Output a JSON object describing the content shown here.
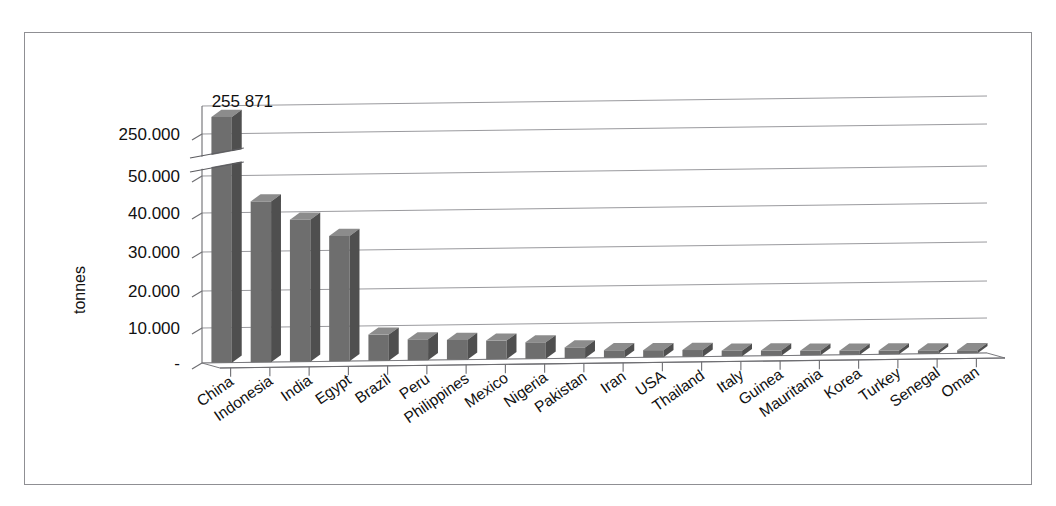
{
  "chart_data": {
    "type": "bar",
    "title": "",
    "subtitle": "",
    "xlabel": "",
    "ylabel": "tonnes",
    "grid": true,
    "legend": "none",
    "orientation": "vertical",
    "style": "3d-column",
    "axis_break": {
      "present": true,
      "between": [
        50000,
        250000
      ],
      "note": "zig-zag break on value axis between 50.000 and 250.000"
    },
    "ytick_labels": [
      "250.000",
      "50.000",
      "40.000",
      "30.000",
      "20.000",
      "10.000",
      "-"
    ],
    "ytick_values": [
      250000,
      50000,
      40000,
      30000,
      20000,
      10000,
      0
    ],
    "ylim": [
      0,
      260000
    ],
    "categories": [
      "China",
      "Indonesia",
      "India",
      "Egypt",
      "Brazil",
      "Peru",
      "Philippines",
      "Mexico",
      "Nigeria",
      "Pakistan",
      "Iran",
      "USA",
      "Thailand",
      "Italy",
      "Guinea",
      "Mauritania",
      "Korea",
      "Turkey",
      "Senegal",
      "Oman"
    ],
    "values": [
      255871,
      43000,
      38000,
      33500,
      7000,
      5600,
      5300,
      5000,
      4400,
      2900,
      2000,
      1900,
      1800,
      1500,
      1400,
      1200,
      1100,
      1000,
      900,
      800
    ],
    "data_labels": [
      {
        "category": "China",
        "text": "255 871"
      }
    ],
    "colors": {
      "bar_front": "#6e6e6e",
      "bar_top": "#8c8c8c",
      "bar_side": "#4f4f4f",
      "gridline": "#9a9a9e",
      "axis": "#6d6d71",
      "border": "#8f8f93",
      "background": "#ffffff",
      "text": "#111111"
    }
  }
}
